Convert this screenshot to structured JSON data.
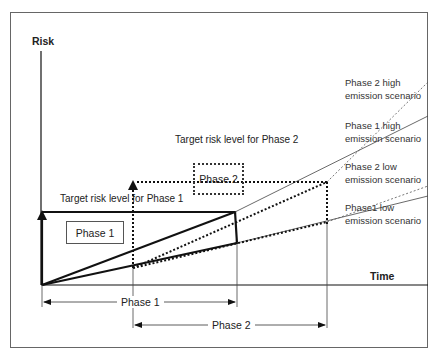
{
  "axes": {
    "y_label": "Risk",
    "x_label": "Time"
  },
  "targets": {
    "phase1_label": "Target risk level for Phase 1",
    "phase2_label": "Target risk level for Phase 2"
  },
  "boxes": {
    "phase1": "Phase 1",
    "phase2": "Phase 2"
  },
  "scenarios": [
    {
      "label": "Phase 2 high\nemission scenario",
      "style": "dotted-thin"
    },
    {
      "label": "Phase 1 high\nemission scenario",
      "style": "solid-thin"
    },
    {
      "label": "Phase 2 low\nemission scenario",
      "style": "dotted-thin"
    },
    {
      "label": "Phase1 low\nemission scenario",
      "style": "solid-thin"
    }
  ],
  "spans": {
    "phase1": "Phase 1",
    "phase2": "Phase 2"
  },
  "colors": {
    "line": "#111111",
    "thin_line": "#444444",
    "frame": "#555555"
  }
}
